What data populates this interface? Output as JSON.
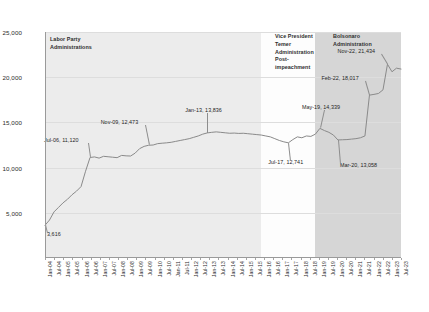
{
  "chart_data": {
    "type": "line",
    "title": "",
    "xlabel": "",
    "ylabel": "",
    "ylim": [
      0,
      25000
    ],
    "yticks": [
      0,
      5000,
      10000,
      15000,
      20000,
      25000
    ],
    "ytick_labels": [
      "",
      "5,000",
      "10,000",
      "15,000",
      "20,000",
      "25,000"
    ],
    "grid": true,
    "legend": "none",
    "xtick_labels": [
      "Jan-04",
      "Jul-04",
      "Jan-05",
      "Jul-05",
      "Jan-06",
      "Jul-06",
      "Jan-07",
      "Jul-07",
      "Jan-08",
      "Jul-08",
      "Jan-09",
      "Jul-09",
      "Jan-10",
      "Jul-10",
      "Jan-11",
      "Jul-11",
      "Jan-12",
      "Jul-12",
      "Jan-13",
      "Jul-13",
      "Jan-14",
      "Jul-14",
      "Jan-15",
      "Jul-15",
      "Jan-16",
      "Jul-16",
      "Jan-17",
      "Jul-17",
      "Jan-18",
      "Jul-18",
      "Jan-19",
      "Jul-19",
      "Jan-20",
      "Jul-20",
      "Jan-21",
      "Jul-21",
      "Jan-22",
      "Jul-22",
      "Jan-23",
      "Jul-23"
    ],
    "x": [
      "Jan-04",
      "Apr-04",
      "Jul-04",
      "Oct-04",
      "Jan-05",
      "Apr-05",
      "Jul-05",
      "Oct-05",
      "Jan-06",
      "Apr-06",
      "Jul-06",
      "Oct-06",
      "Jan-07",
      "Apr-07",
      "Jul-07",
      "Oct-07",
      "Jan-08",
      "Apr-08",
      "Jul-08",
      "Oct-08",
      "Jan-09",
      "Apr-09",
      "Jul-09",
      "Nov-09",
      "Jan-10",
      "Apr-10",
      "Jul-10",
      "Oct-10",
      "Jan-11",
      "Apr-11",
      "Jul-11",
      "Oct-11",
      "Jan-12",
      "Apr-12",
      "Jul-12",
      "Oct-12",
      "Jan-13",
      "Apr-13",
      "Jul-13",
      "Oct-13",
      "Jan-14",
      "Apr-14",
      "Jul-14",
      "Oct-14",
      "Jan-15",
      "Apr-15",
      "Jul-15",
      "Oct-15",
      "Jan-16",
      "Apr-16",
      "Jul-16",
      "Oct-16",
      "Jan-17",
      "Apr-17",
      "Jul-17",
      "Oct-17",
      "Jan-18",
      "Apr-18",
      "Jul-18",
      "Oct-18",
      "Jan-19",
      "May-19",
      "Jul-19",
      "Oct-19",
      "Jan-20",
      "Mar-20",
      "Jul-20",
      "Oct-20",
      "Jan-21",
      "Apr-21",
      "Jul-21",
      "Oct-21",
      "Feb-22",
      "Apr-22",
      "Jul-22",
      "Oct-22",
      "Nov-22",
      "Jan-23",
      "Apr-23",
      "Jul-23"
    ],
    "values": [
      3616,
      4200,
      5100,
      5600,
      6100,
      6500,
      7000,
      7400,
      7900,
      9600,
      11120,
      11180,
      11050,
      11250,
      11200,
      11150,
      11100,
      11350,
      11300,
      11280,
      11600,
      12100,
      12350,
      12473,
      12500,
      12650,
      12700,
      12740,
      12800,
      12900,
      13000,
      13100,
      13200,
      13350,
      13500,
      13700,
      13836,
      13900,
      13950,
      13900,
      13850,
      13800,
      13820,
      13780,
      13800,
      13750,
      13700,
      13650,
      13600,
      13500,
      13400,
      13200,
      13000,
      12850,
      12741,
      13100,
      13400,
      13300,
      13500,
      13450,
      13700,
      14339,
      14100,
      13900,
      13600,
      13058,
      13080,
      13100,
      13150,
      13200,
      13300,
      13500,
      18017,
      18100,
      18200,
      18600,
      21434,
      20600,
      21000,
      20900
    ],
    "annotations": [
      {
        "label": "3,616",
        "x": "Jan-04",
        "y": 3616
      },
      {
        "label": "Jul-06, 11,120",
        "x": "Jul-06",
        "y": 11120
      },
      {
        "label": "Nov-09, 12,473",
        "x": "Nov-09",
        "y": 12473
      },
      {
        "label": "Jan-13, 13,836",
        "x": "Jan-13",
        "y": 13836
      },
      {
        "label": "Jul-17, 12,741",
        "x": "Jul-17",
        "y": 12741
      },
      {
        "label": "May-19, 14,339",
        "x": "May-19",
        "y": 14339
      },
      {
        "label": "Mar-20, 13,058",
        "x": "Mar-20",
        "y": 13058
      },
      {
        "label": "Feb-22, 18,017",
        "x": "Feb-22",
        "y": 18017
      },
      {
        "label": "Nov-22, 21,434",
        "x": "Nov-22",
        "y": 21434
      }
    ],
    "regions": [
      {
        "name": "labor-party",
        "label": "Labor Party\nAdministrations"
      },
      {
        "name": "temer",
        "label": "Vice President\nTemer\nAdministration\nPost-\nimpeachment"
      },
      {
        "name": "bolsonaro",
        "label": "Bolsonaro\nAdministration"
      }
    ],
    "colors": {
      "line": "#8a8a8a",
      "band_labor": "#ececec",
      "band_temer": "#fdfdfd",
      "band_bolsonaro": "#d6d6d6",
      "gridline": "#dddddd",
      "axis": "#9a9a9a",
      "text": "#2b2b2b"
    }
  }
}
